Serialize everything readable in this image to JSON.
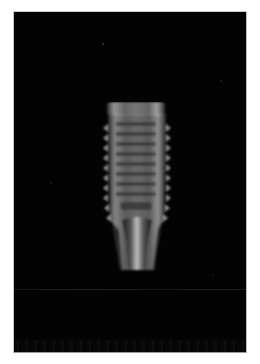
{
  "image": {
    "subject": "Dental implant radiograph",
    "description": "Grayscale X-ray of a threaded dental implant on a black background",
    "colors": {
      "background": "#030303",
      "implant_light": "#cfcfcf",
      "implant_mid": "#8a8a8a",
      "implant_dark": "#3c3c3c",
      "border": "#c8c8c8"
    }
  }
}
